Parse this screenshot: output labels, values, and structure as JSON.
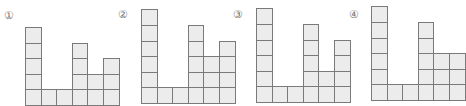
{
  "cell_size": 15.6,
  "colors": {
    "cell_fill": "#ececec",
    "cell_border": "#7a7a7a",
    "label": "#777777"
  },
  "figures": [
    {
      "label": "①",
      "label_pos": [
        3,
        10
      ],
      "origin": [
        25,
        105
      ],
      "heights": [
        5,
        1,
        1,
        4,
        2,
        3
      ]
    },
    {
      "label": "②",
      "label_pos": [
        117,
        9
      ],
      "origin": [
        141,
        103
      ],
      "heights": [
        6,
        1,
        1,
        5,
        3,
        4
      ]
    },
    {
      "label": "③",
      "label_pos": [
        232,
        9
      ],
      "origin": [
        256,
        102
      ],
      "heights": [
        6,
        1,
        1,
        5,
        2,
        4
      ]
    },
    {
      "label": "④",
      "label_pos": [
        348,
        9
      ],
      "origin": [
        371,
        100
      ],
      "heights": [
        6,
        1,
        1,
        5,
        3,
        3
      ]
    }
  ]
}
